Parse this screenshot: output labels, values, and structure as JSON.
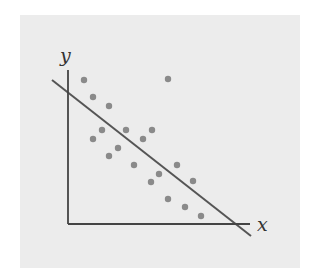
{
  "chart_data": {
    "type": "scatter",
    "title": "",
    "xlabel": "x",
    "ylabel": "y",
    "grid": false,
    "legend": null,
    "xlim": [
      0,
      18.5
    ],
    "ylim": [
      0,
      15.5
    ],
    "series": [
      {
        "name": "points",
        "x": [
          1.6,
          10.0,
          2.5,
          4.1,
          3.4,
          5.8,
          8.4,
          2.5,
          7.5,
          5.0,
          4.1,
          6.6,
          10.9,
          9.1,
          8.3,
          12.5,
          10.0,
          11.7,
          13.3
        ],
        "y": [
          14.4,
          14.5,
          12.7,
          11.8,
          9.4,
          9.4,
          9.4,
          8.5,
          8.5,
          7.6,
          6.8,
          5.9,
          5.9,
          5.0,
          4.2,
          4.3,
          2.5,
          1.7,
          0.8
        ]
      }
    ],
    "fit_line": {
      "name": "regression line",
      "x": [
        -1.6,
        18.3
      ],
      "y": [
        14.4,
        -1.2
      ]
    },
    "color_points": "#8a8a8a",
    "color_line": "#555555",
    "color_background": "#ececec"
  }
}
